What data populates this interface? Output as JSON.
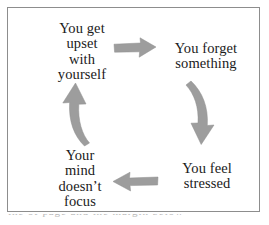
{
  "diagram": {
    "type": "cycle",
    "border_color": "#8d8d8d",
    "background_color": "#ffffff",
    "text_color": "#1a1a1a",
    "arrow_color": "#9a9a9a",
    "nodes": [
      {
        "id": "upset",
        "position": "top-left",
        "lines": [
          "You get",
          "upset",
          "with",
          "yourself"
        ],
        "line1": "You get",
        "line2": "upset",
        "line3": "with",
        "line4": "yourself"
      },
      {
        "id": "forget",
        "position": "top-right",
        "lines": [
          "You forget",
          "something"
        ],
        "line1": "You forget",
        "line2": "something"
      },
      {
        "id": "stressed",
        "position": "bottom-right",
        "lines": [
          "You feel",
          "stressed"
        ],
        "line1": "You feel",
        "line2": "stressed"
      },
      {
        "id": "focus",
        "position": "bottom-left",
        "lines": [
          "Your",
          "mind",
          "doesn’t",
          "focus"
        ],
        "line1": "Your",
        "line2": "mind",
        "line3": "doesn’t",
        "line4": "focus"
      }
    ],
    "arrows": [
      {
        "id": "top",
        "from": "upset",
        "to": "forget",
        "direction": "right",
        "shape": "straight"
      },
      {
        "id": "right",
        "from": "forget",
        "to": "stressed",
        "direction": "down",
        "shape": "curved"
      },
      {
        "id": "bottom",
        "from": "stressed",
        "to": "focus",
        "direction": "left",
        "shape": "straight"
      },
      {
        "id": "left",
        "from": "focus",
        "to": "upset",
        "direction": "up",
        "shape": "curved"
      }
    ]
  },
  "caption": {
    "cut_off_text": "the of page and the margin below"
  }
}
